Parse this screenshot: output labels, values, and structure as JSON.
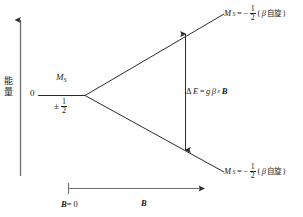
{
  "figure": {
    "type": "zeeman-splitting-energy-diagram",
    "stroke_color": "#2b2b2b",
    "background_color": "#ffffff"
  },
  "axes": {
    "y": {
      "label_chars": [
        "能",
        "量"
      ],
      "label": "能量",
      "arrow_direction": "up"
    },
    "x": {
      "origin_tick_label_symbol": "B",
      "origin_tick_label_eq": "= 0",
      "origin_tick_label": "B = 0",
      "axis_label": "B",
      "arrow_direction": "right"
    }
  },
  "zero_level": {
    "energy_label": "0",
    "quantum_number_symbol": "M",
    "quantum_number_subscript": "S",
    "value_sign": "±",
    "value_numerator": "1",
    "value_denominator": "2"
  },
  "states": [
    {
      "position": "upper",
      "symbol": "M",
      "subscript": "S",
      "equals": "=",
      "sign": "−",
      "numerator": "1",
      "denominator": "2",
      "paren_open": "(",
      "greek": "β",
      "spin_text": "自旋",
      "paren_close": ")"
    },
    {
      "position": "lower",
      "symbol": "M",
      "subscript": "S",
      "equals": "=",
      "sign": "−",
      "numerator": "1",
      "denominator": "2",
      "paren_open": "(",
      "greek": "β",
      "spin_text": "自旋",
      "paren_close": ")"
    }
  ],
  "splitting": {
    "delta": "Δ",
    "energy_symbol": "E",
    "equals": "=",
    "g_factor": "g",
    "bohr_magneton": "β",
    "bohr_magneton_subscript": "e",
    "field_symbol": "B",
    "expression": "ΔE = gβeB"
  }
}
